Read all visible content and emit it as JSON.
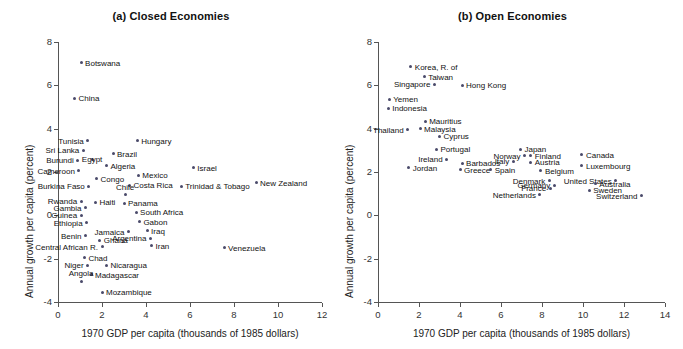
{
  "figure": {
    "ylabel": "Annual growth per capita (percent)",
    "xlabel": "1970 GDP per capita (thousands of 1985 dollars)"
  },
  "chart_data": [
    {
      "type": "scatter",
      "title": "(a) Closed Economies",
      "xlabel": "1970 GDP per capita (thousands of 1985 dollars)",
      "ylabel": "Annual growth per capita (percent)",
      "xlim": [
        0,
        12
      ],
      "ylim": [
        -4,
        8
      ],
      "xticks": [
        0,
        2,
        4,
        6,
        8,
        10,
        12
      ],
      "yticks": [
        -4,
        -2,
        0,
        2,
        4,
        6,
        8
      ],
      "grid": false,
      "legend": null,
      "points": [
        {
          "label": "Botswana",
          "x": 1.05,
          "y": 7.05,
          "pos": "l"
        },
        {
          "label": "China",
          "x": 0.75,
          "y": 5.4,
          "pos": "l"
        },
        {
          "label": "Tunisia",
          "x": 1.35,
          "y": 3.45,
          "pos": "r"
        },
        {
          "label": "Hungary",
          "x": 3.6,
          "y": 3.45,
          "pos": "l"
        },
        {
          "label": "Sri Lanka",
          "x": 1.15,
          "y": 3.0,
          "pos": "r"
        },
        {
          "label": "Brazil",
          "x": 2.5,
          "y": 2.85,
          "pos": "l"
        },
        {
          "label": "Burundi",
          "x": 0.9,
          "y": 2.55,
          "pos": "r"
        },
        {
          "label": "Egypt",
          "x": 1.55,
          "y": 2.6,
          "pos": "c"
        },
        {
          "label": "Algeria",
          "x": 2.2,
          "y": 2.3,
          "pos": "l"
        },
        {
          "label": "Cameroon",
          "x": 0.95,
          "y": 2.05,
          "pos": "r"
        },
        {
          "label": "Israel",
          "x": 6.15,
          "y": 2.2,
          "pos": "l"
        },
        {
          "label": "Congo",
          "x": 1.75,
          "y": 1.7,
          "pos": "l"
        },
        {
          "label": "Mexico",
          "x": 3.65,
          "y": 1.85,
          "pos": "l"
        },
        {
          "label": "Costa Rica",
          "x": 3.25,
          "y": 1.4,
          "pos": "l"
        },
        {
          "label": "Burkina Faso",
          "x": 1.4,
          "y": 1.35,
          "pos": "r"
        },
        {
          "label": "Chile",
          "x": 3.05,
          "y": 0.95,
          "pos": "tc"
        },
        {
          "label": "Trinidad & Tobago",
          "x": 5.6,
          "y": 1.35,
          "pos": "l"
        },
        {
          "label": "New Zealand",
          "x": 9.0,
          "y": 1.5,
          "pos": "l"
        },
        {
          "label": "Rwanda",
          "x": 1.05,
          "y": 0.65,
          "pos": "r"
        },
        {
          "label": "Haiti",
          "x": 1.7,
          "y": 0.6,
          "pos": "l"
        },
        {
          "label": "Panama",
          "x": 3.0,
          "y": 0.55,
          "pos": "l"
        },
        {
          "label": "Gambia",
          "x": 1.25,
          "y": 0.35,
          "pos": "r"
        },
        {
          "label": "South Africa",
          "x": 3.55,
          "y": 0.15,
          "pos": "l"
        },
        {
          "label": "Guinea",
          "x": 1.05,
          "y": 0.0,
          "pos": "r"
        },
        {
          "label": "Gabon",
          "x": 3.7,
          "y": -0.3,
          "pos": "l"
        },
        {
          "label": "Ethiopia",
          "x": 1.3,
          "y": -0.35,
          "pos": "r"
        },
        {
          "label": "Jamaica",
          "x": 3.2,
          "y": -0.75,
          "pos": "r"
        },
        {
          "label": "Iraq",
          "x": 4.05,
          "y": -0.7,
          "pos": "l"
        },
        {
          "label": "Benin",
          "x": 1.25,
          "y": -0.95,
          "pos": "r"
        },
        {
          "label": "Argentina",
          "x": 4.2,
          "y": -1.05,
          "pos": "r"
        },
        {
          "label": "Ghana",
          "x": 1.9,
          "y": -1.15,
          "pos": "l"
        },
        {
          "label": "Central African R.",
          "x": 2.0,
          "y": -1.45,
          "pos": "r"
        },
        {
          "label": "Iran",
          "x": 4.25,
          "y": -1.4,
          "pos": "l"
        },
        {
          "label": "Venezuela",
          "x": 7.55,
          "y": -1.5,
          "pos": "l"
        },
        {
          "label": "Chad",
          "x": 1.2,
          "y": -1.95,
          "pos": "l"
        },
        {
          "label": "Niger",
          "x": 1.35,
          "y": -2.3,
          "pos": "r"
        },
        {
          "label": "Nicaragua",
          "x": 2.2,
          "y": -2.3,
          "pos": "l"
        },
        {
          "label": "Madagascar",
          "x": 1.5,
          "y": -2.75,
          "pos": "l"
        },
        {
          "label": "Angola",
          "x": 1.05,
          "y": -3.05,
          "pos": "tc"
        },
        {
          "label": "Mozambique",
          "x": 2.0,
          "y": -3.55,
          "pos": "l"
        }
      ]
    },
    {
      "type": "scatter",
      "title": "(b) Open Economies",
      "xlabel": "1970 GDP per capita (thousands of 1985 dollars)",
      "ylabel": "Annual growth per capita (percent)",
      "xlim": [
        0,
        14
      ],
      "ylim": [
        -4,
        8
      ],
      "xticks": [
        0,
        2,
        4,
        6,
        8,
        10,
        12,
        14
      ],
      "yticks": [
        -4,
        -2,
        0,
        2,
        4,
        6,
        8
      ],
      "grid": false,
      "legend": null,
      "points": [
        {
          "label": "Korea, R. of",
          "x": 1.6,
          "y": 6.85,
          "pos": "l"
        },
        {
          "label": "Taiwan",
          "x": 2.25,
          "y": 6.4,
          "pos": "l"
        },
        {
          "label": "Singapore",
          "x": 2.75,
          "y": 6.05,
          "pos": "r"
        },
        {
          "label": "Hong Kong",
          "x": 4.1,
          "y": 6.0,
          "pos": "l"
        },
        {
          "label": "Yemen",
          "x": 0.55,
          "y": 5.35,
          "pos": "l"
        },
        {
          "label": "Indonesia",
          "x": 0.5,
          "y": 4.95,
          "pos": "l"
        },
        {
          "label": "Mauritius",
          "x": 2.3,
          "y": 4.35,
          "pos": "l"
        },
        {
          "label": "Malaysia",
          "x": 2.05,
          "y": 4.0,
          "pos": "l"
        },
        {
          "label": "Thailand",
          "x": 1.45,
          "y": 3.95,
          "pos": "r"
        },
        {
          "label": "Cyprus",
          "x": 3.0,
          "y": 3.65,
          "pos": "l"
        },
        {
          "label": "Portugal",
          "x": 2.85,
          "y": 3.05,
          "pos": "l"
        },
        {
          "label": "Japan",
          "x": 6.95,
          "y": 3.05,
          "pos": "l"
        },
        {
          "label": "Norway",
          "x": 7.15,
          "y": 2.75,
          "pos": "r"
        },
        {
          "label": "Finland",
          "x": 7.45,
          "y": 2.75,
          "pos": "l"
        },
        {
          "label": "Canada",
          "x": 9.95,
          "y": 2.8,
          "pos": "l"
        },
        {
          "label": "Ireland",
          "x": 3.35,
          "y": 2.6,
          "pos": "r"
        },
        {
          "label": "Italy",
          "x": 6.6,
          "y": 2.5,
          "pos": "r"
        },
        {
          "label": "Austria",
          "x": 7.45,
          "y": 2.45,
          "pos": "l"
        },
        {
          "label": "Barbados",
          "x": 4.1,
          "y": 2.4,
          "pos": "l"
        },
        {
          "label": "Luxembourg",
          "x": 9.95,
          "y": 2.3,
          "pos": "l"
        },
        {
          "label": "Jordan",
          "x": 1.5,
          "y": 2.2,
          "pos": "l"
        },
        {
          "label": "Greece",
          "x": 4.0,
          "y": 2.1,
          "pos": "l"
        },
        {
          "label": "Spain",
          "x": 5.5,
          "y": 2.1,
          "pos": "l"
        },
        {
          "label": "Belgium",
          "x": 7.95,
          "y": 2.05,
          "pos": "l"
        },
        {
          "label": "Denmark",
          "x": 8.35,
          "y": 1.6,
          "pos": "r"
        },
        {
          "label": "United States",
          "x": 11.6,
          "y": 1.6,
          "pos": "r"
        },
        {
          "label": "Germany",
          "x": 8.6,
          "y": 1.4,
          "pos": "r"
        },
        {
          "label": "Australia",
          "x": 10.6,
          "y": 1.45,
          "pos": "l"
        },
        {
          "label": "France",
          "x": 8.4,
          "y": 1.25,
          "pos": "r"
        },
        {
          "label": "Sweden",
          "x": 10.3,
          "y": 1.15,
          "pos": "l"
        },
        {
          "label": "Netherlands",
          "x": 7.9,
          "y": 0.95,
          "pos": "r"
        },
        {
          "label": "Switzerland",
          "x": 12.85,
          "y": 0.9,
          "pos": "r"
        }
      ]
    }
  ]
}
